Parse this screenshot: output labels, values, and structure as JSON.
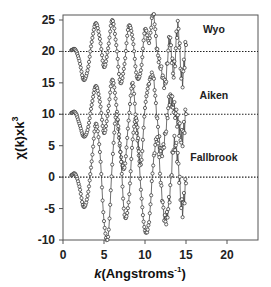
{
  "chart_data": {
    "type": "line",
    "title": "",
    "xlabel": "k(Angstroms^-1)",
    "xlabel_parts": {
      "italic": "k",
      "main": "(Angstroms",
      "sup": "-1",
      "close": ")"
    },
    "ylabel": "χ(k)xk^3",
    "ylabel_parts": {
      "main": "χ(k)xk",
      "sup": "3"
    },
    "xlim": [
      0,
      24
    ],
    "ylim": [
      -10,
      26
    ],
    "xticks": [
      0,
      5,
      10,
      15,
      20
    ],
    "xtick_labels": [
      "0",
      "5",
      "10",
      "15",
      "20"
    ],
    "yticks": [
      25,
      20,
      15,
      10,
      5,
      0,
      -5,
      -10
    ],
    "ytick_labels": [
      "25",
      "20",
      "15",
      "10",
      "5",
      "0",
      "-5",
      "-10"
    ],
    "grid": false,
    "legend": "inline labels at right of each curve",
    "marker": "open circle",
    "series": [
      {
        "name": "Wyo",
        "offset": 20,
        "baseline": 20,
        "label_pos": {
          "x": 18.4,
          "y": 23
        },
        "k": [
          1.0,
          1.5,
          2.0,
          2.5,
          3.0,
          3.5,
          4.0,
          4.5,
          5.0,
          5.5,
          6.0,
          6.5,
          7.0,
          7.5,
          8.0,
          8.5,
          9.0,
          9.5,
          10.0,
          10.5,
          11.0,
          11.5,
          12.0,
          12.5,
          13.0,
          13.5,
          14.0,
          14.5,
          15.0
        ],
        "chi_k3": [
          0.2,
          0.3,
          -1.5,
          -4.5,
          -3.0,
          1.5,
          4.5,
          2.0,
          -2.5,
          0.5,
          5.0,
          1.0,
          -5.0,
          -2.0,
          4.0,
          2.0,
          -4.0,
          -3.0,
          3.5,
          1.5,
          6.0,
          0.0,
          -3.0,
          -5.0,
          2.0,
          -3.5,
          4.0,
          -4.5,
          1.0
        ]
      },
      {
        "name": "Aiken",
        "offset": 10,
        "baseline": 10,
        "label_pos": {
          "x": 18.4,
          "y": 12.5
        },
        "k": [
          1.0,
          1.5,
          2.0,
          2.5,
          3.0,
          3.5,
          4.0,
          4.5,
          5.0,
          5.5,
          6.0,
          6.5,
          7.0,
          7.5,
          8.0,
          8.5,
          9.0,
          9.5,
          10.0,
          10.5,
          11.0,
          11.5,
          12.0,
          12.5,
          13.0,
          13.5,
          14.0,
          14.5,
          15.0
        ],
        "chi_k3": [
          0.2,
          0.3,
          -1.5,
          -3.5,
          -2.5,
          1.5,
          4.5,
          2.0,
          -3.0,
          0.5,
          5.5,
          1.5,
          -6.0,
          -8.5,
          -1.0,
          5.0,
          -3.0,
          -8.0,
          1.0,
          5.0,
          6.0,
          -1.0,
          -6.0,
          -3.0,
          2.5,
          1.0,
          -1.0,
          -4.0,
          0.0
        ]
      },
      {
        "name": "Fallbrook",
        "offset": 0,
        "baseline": 0,
        "label_pos": {
          "x": 18.4,
          "y": 2.5
        },
        "k": [
          1.0,
          1.5,
          2.0,
          2.5,
          3.0,
          3.5,
          4.0,
          4.5,
          5.0,
          5.5,
          6.0,
          6.5,
          7.0,
          7.5,
          8.0,
          8.5,
          9.0,
          9.5,
          10.0,
          10.5,
          11.0,
          11.5,
          12.0,
          12.5,
          13.0,
          13.5,
          14.0,
          14.5,
          15.0
        ],
        "chi_k3": [
          0.3,
          0.5,
          -1.5,
          -4.7,
          -3.0,
          2.5,
          8.5,
          4.0,
          -7.0,
          -9.5,
          2.0,
          10.0,
          4.0,
          -6.0,
          -4.0,
          6.0,
          9.0,
          -2.0,
          -8.5,
          -7.0,
          2.0,
          6.0,
          -2.0,
          -7.0,
          -3.0,
          5.0,
          3.0,
          -5.0,
          -1.0
        ]
      }
    ],
    "dotted_lines": [
      20,
      10,
      0
    ]
  },
  "colors": {
    "line": "#333333",
    "marker_stroke": "#2a2a2a",
    "marker_fill": "#ffffff",
    "frame": "#555555",
    "dotted": "#222222",
    "text": "#222222"
  }
}
